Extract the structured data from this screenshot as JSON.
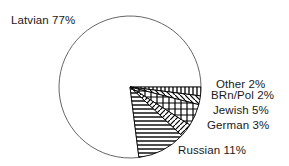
{
  "chart_data": {
    "type": "pie",
    "title": "",
    "subtitle": "",
    "xlabel": "",
    "ylabel": "",
    "legend_position": "none",
    "grid": false,
    "start_angle_deg": 0,
    "direction": "clockwise",
    "categories": [
      "Latvian",
      "Russian",
      "Jewish",
      "German",
      "BRn/Pol",
      "Other"
    ],
    "values": [
      77,
      11,
      5,
      3,
      2,
      2
    ],
    "unit": "%",
    "slices": [
      {
        "id": "latvian",
        "name": "Latvian",
        "value": 77,
        "label": "Latvian 77%",
        "pattern": "blank",
        "fill": "#ffffff",
        "stroke": "#555555"
      },
      {
        "id": "other",
        "name": "Other",
        "value": 2,
        "label": "Other 2%",
        "pattern": "vertical-lines",
        "fill": "#ffffff",
        "stroke": "#000000"
      },
      {
        "id": "brnpol",
        "name": "BRn/Pol",
        "value": 2,
        "label": "BRn/Pol 2%",
        "pattern": "diagonal-lines-down",
        "fill": "#ffffff",
        "stroke": "#000000"
      },
      {
        "id": "jewish",
        "name": "Jewish",
        "value": 5,
        "label": "Jewish 5%",
        "pattern": "cross-hatch",
        "fill": "#ffffff",
        "stroke": "#000000"
      },
      {
        "id": "german",
        "name": "German",
        "value": 3,
        "label": "German 3%",
        "pattern": "diagonal-lines-up",
        "fill": "#ffffff",
        "stroke": "#000000"
      },
      {
        "id": "russian",
        "name": "Russian",
        "value": 11,
        "label": "Russian 11%",
        "pattern": "horizontal-lines",
        "fill": "#ffffff",
        "stroke": "#000000"
      }
    ],
    "geometry": {
      "center_x": 130,
      "center_y": 87,
      "radius": 71
    }
  },
  "labels": {
    "latvian": "Latvian 77%",
    "other": "Other 2%",
    "brnpol": "BRn/Pol 2%",
    "jewish": "Jewish 5%",
    "german": "German 3%",
    "russian": "Russian 11%"
  },
  "colors": {
    "background": "#ffffff",
    "outline": "#555555",
    "hatch": "#000000",
    "text": "#1a1a1a"
  }
}
